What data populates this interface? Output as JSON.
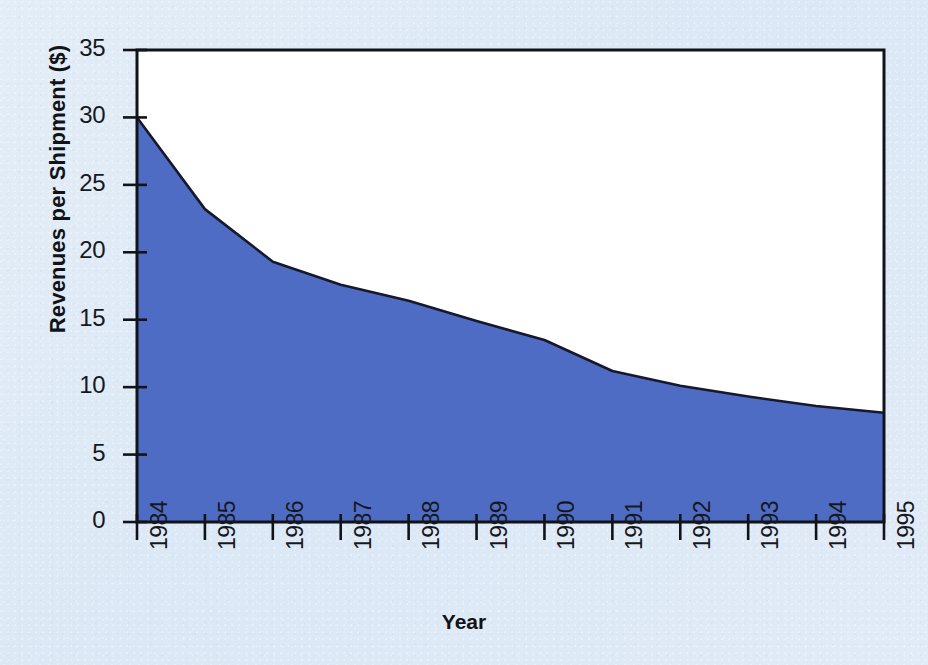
{
  "chart_data": {
    "type": "area",
    "title": "",
    "subtitle": "",
    "xlabel": "Year",
    "ylabel": "Revenues per Shipment ($)",
    "categories": [
      "1984",
      "1985",
      "1986",
      "1987",
      "1988",
      "1989",
      "1990",
      "1991",
      "1992",
      "1993",
      "1994",
      "1995"
    ],
    "values": [
      30.0,
      23.2,
      19.3,
      17.6,
      16.4,
      14.9,
      13.5,
      11.2,
      10.1,
      9.3,
      8.6,
      8.1
    ],
    "series": [
      {
        "name": "Revenues per Shipment",
        "values": [
          30.0,
          23.2,
          19.3,
          17.6,
          16.4,
          14.9,
          13.5,
          11.2,
          10.1,
          9.3,
          8.6,
          8.1
        ]
      }
    ],
    "ylim": [
      0,
      35
    ],
    "yticks": [
      0,
      5,
      10,
      15,
      20,
      25,
      30,
      35
    ],
    "ytick_labels": [
      "0",
      "5",
      "10",
      "15",
      "20",
      "25",
      "30",
      "35"
    ],
    "xtick_labels": [
      "1984",
      "1985",
      "1986",
      "1987",
      "1988",
      "1989",
      "1990",
      "1991",
      "1992",
      "1993",
      "1994",
      "1995"
    ],
    "grid": false,
    "legend": "none",
    "annotations": [],
    "colors": {
      "area_fill": "#4f6cc4",
      "area_line": "#16182b",
      "plot_background": "#ffffff",
      "figure_background": "#dfeaf6",
      "axis": "#111318",
      "text": "#16181d"
    }
  }
}
